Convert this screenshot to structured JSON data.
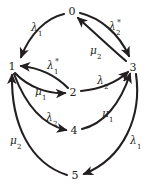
{
  "diagram": {
    "type": "state-transition-diagram",
    "background_color": "#ffffff",
    "stroke_color": "#231f20",
    "nodes": [
      {
        "id": "0",
        "label": "0",
        "x": 72,
        "y": 11
      },
      {
        "id": "1",
        "label": "1",
        "x": 12,
        "y": 66
      },
      {
        "id": "2",
        "label": "2",
        "x": 73,
        "y": 92
      },
      {
        "id": "3",
        "label": "3",
        "x": 133,
        "y": 67
      },
      {
        "id": "4",
        "label": "4",
        "x": 74,
        "y": 130
      },
      {
        "id": "5",
        "label": "5",
        "x": 75,
        "y": 175
      }
    ],
    "edges": [
      {
        "id": "e0",
        "from": "0",
        "to": "1",
        "symbol": "λ",
        "sub": "1",
        "sup": "",
        "label_x": 35,
        "label_y": 27
      },
      {
        "id": "e1",
        "from": "0",
        "to": "3",
        "symbol": "λ",
        "sub": "2",
        "sup": "*",
        "label_x": 115,
        "label_y": 26
      },
      {
        "id": "e2",
        "from": "3",
        "to": "0",
        "symbol": "μ",
        "sub": "2",
        "sup": "",
        "label_x": 94,
        "label_y": 50
      },
      {
        "id": "e3",
        "from": "2",
        "to": "1",
        "symbol": "λ",
        "sub": "1",
        "sup": "*",
        "label_x": 53,
        "label_y": 65
      },
      {
        "id": "e4",
        "from": "1",
        "to": "2",
        "symbol": "μ",
        "sub": "1",
        "sup": "",
        "label_x": 39,
        "label_y": 91
      },
      {
        "id": "e5",
        "from": "2",
        "to": "3",
        "symbol": "λ",
        "sub": "2",
        "sup": "",
        "label_x": 101,
        "label_y": 80
      },
      {
        "id": "e6",
        "from": "1",
        "to": "4",
        "symbol": "λ",
        "sub": "2",
        "sup": "",
        "label_x": 50,
        "label_y": 117
      },
      {
        "id": "e7",
        "from": "4",
        "to": "3",
        "symbol": "μ",
        "sub": "1",
        "sup": "",
        "label_x": 106,
        "label_y": 113
      },
      {
        "id": "e8",
        "from": "3",
        "to": "5",
        "symbol": "λ",
        "sub": "1",
        "sup": "",
        "label_x": 134,
        "label_y": 140
      },
      {
        "id": "e9",
        "from": "5",
        "to": "1",
        "symbol": "μ",
        "sub": "2",
        "sup": "",
        "label_x": 14,
        "label_y": 140
      }
    ]
  }
}
